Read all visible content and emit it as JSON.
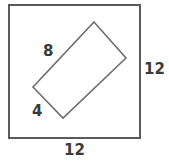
{
  "figure": {
    "type": "geometry-diagram",
    "colors": {
      "square_stroke": "#5a5a5a",
      "rectangle_stroke": "#6e6e6e",
      "label_text": "#3a3a3a",
      "background": "#ffffff"
    },
    "square": {
      "name": "outer-square",
      "stroke_width": 2,
      "corners": [
        {
          "x": 9,
          "y": 5
        },
        {
          "x": 140,
          "y": 5
        },
        {
          "x": 140,
          "y": 138
        },
        {
          "x": 9,
          "y": 138
        }
      ],
      "labels": {
        "right_side": "12",
        "bottom_side": "12"
      }
    },
    "rectangle": {
      "name": "inscribed-rectangle",
      "stroke_width": 1.6,
      "vertices": [
        {
          "name": "top",
          "x": 94,
          "y": 22
        },
        {
          "name": "right",
          "x": 126,
          "y": 58
        },
        {
          "name": "bottom",
          "x": 63,
          "y": 118
        },
        {
          "name": "left",
          "x": 33,
          "y": 87
        }
      ],
      "labels": {
        "long_side": "8",
        "short_side": "4"
      }
    }
  }
}
